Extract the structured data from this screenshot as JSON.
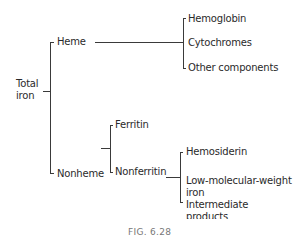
{
  "diagram": {
    "root": {
      "label_line1": "Total",
      "label_line2": "iron"
    },
    "heme": {
      "label": "Heme",
      "children": [
        "Hemoglobin",
        "Cytochromes",
        "Other components"
      ]
    },
    "nonheme": {
      "label": "Nonheme",
      "ferritin": "Ferritin",
      "nonferritin": {
        "label": "Nonferritin",
        "children": [
          {
            "line1": "Hemosiderin"
          },
          {
            "line1": "Low-molecular-weight",
            "line2": "iron"
          },
          {
            "line1": "Intermediate",
            "line2": "products"
          }
        ]
      }
    },
    "line_color": "#3a3a3a"
  },
  "caption": "FIG. 6.28"
}
